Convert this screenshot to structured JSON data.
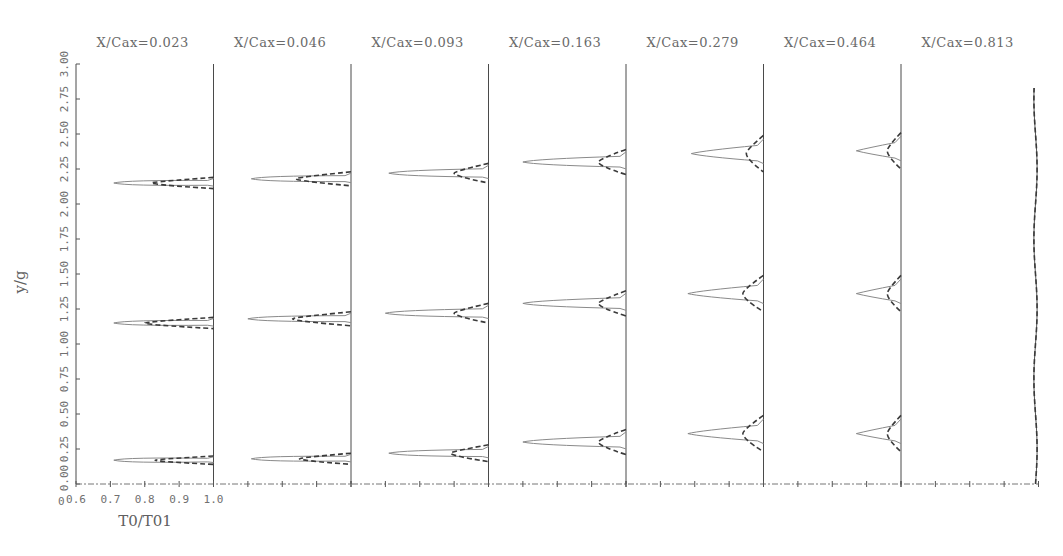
{
  "chart_data": {
    "type": "line",
    "title": "",
    "xlabel": "T0/T01",
    "ylabel": "y/g",
    "ylim": [
      0.0,
      3.0
    ],
    "xlim_per_panel": [
      0.6,
      1.0
    ],
    "y_ticks": [
      "0.00",
      "0.25",
      "0.50",
      "0.75",
      "1.00",
      "1.25",
      "1.50",
      "1.75",
      "2.00",
      "2.25",
      "2.50",
      "2.75",
      "3.00"
    ],
    "x_ticks": [
      "0.6",
      "0.7",
      "0.8",
      "0.9",
      "1.0"
    ],
    "grid": false,
    "legend": null,
    "series_styles": [
      {
        "name": "solid",
        "style": "solid",
        "color": "#8a8a8a"
      },
      {
        "name": "dashed",
        "style": "dashed",
        "color": "#3a3a3a"
      }
    ],
    "panels": [
      {
        "label": "X/Cax=0.023",
        "wakes": [
          {
            "y_center": 0.17,
            "solid_min_x": 0.71,
            "dash_min_x": 0.83,
            "width": 0.06
          },
          {
            "y_center": 1.15,
            "solid_min_x": 0.71,
            "dash_min_x": 0.8,
            "width": 0.08
          },
          {
            "y_center": 2.15,
            "solid_min_x": 0.71,
            "dash_min_x": 0.82,
            "width": 0.08
          }
        ]
      },
      {
        "label": "X/Cax=0.046",
        "wakes": [
          {
            "y_center": 0.18,
            "solid_min_x": 0.71,
            "dash_min_x": 0.85,
            "width": 0.08
          },
          {
            "y_center": 1.18,
            "solid_min_x": 0.7,
            "dash_min_x": 0.83,
            "width": 0.1
          },
          {
            "y_center": 2.18,
            "solid_min_x": 0.71,
            "dash_min_x": 0.84,
            "width": 0.1
          }
        ]
      },
      {
        "label": "X/Cax=0.093",
        "wakes": [
          {
            "y_center": 0.22,
            "solid_min_x": 0.71,
            "dash_min_x": 0.89,
            "width": 0.12
          },
          {
            "y_center": 1.22,
            "solid_min_x": 0.7,
            "dash_min_x": 0.9,
            "width": 0.14
          },
          {
            "y_center": 2.22,
            "solid_min_x": 0.71,
            "dash_min_x": 0.9,
            "width": 0.14
          }
        ]
      },
      {
        "label": "X/Cax=0.163",
        "wakes": [
          {
            "y_center": 0.3,
            "solid_min_x": 0.7,
            "dash_min_x": 0.92,
            "width": 0.18
          },
          {
            "y_center": 1.29,
            "solid_min_x": 0.7,
            "dash_min_x": 0.92,
            "width": 0.18
          },
          {
            "y_center": 2.3,
            "solid_min_x": 0.7,
            "dash_min_x": 0.92,
            "width": 0.18
          }
        ]
      },
      {
        "label": "X/Cax=0.279",
        "wakes": [
          {
            "y_center": 0.36,
            "solid_min_x": 0.78,
            "dash_min_x": 0.94,
            "width": 0.26
          },
          {
            "y_center": 1.36,
            "solid_min_x": 0.78,
            "dash_min_x": 0.94,
            "width": 0.26
          },
          {
            "y_center": 2.36,
            "solid_min_x": 0.79,
            "dash_min_x": 0.95,
            "width": 0.26
          }
        ]
      },
      {
        "label": "X/Cax=0.464",
        "wakes": [
          {
            "y_center": 0.36,
            "solid_min_x": 0.87,
            "dash_min_x": 0.96,
            "width": 0.26
          },
          {
            "y_center": 1.36,
            "solid_min_x": 0.87,
            "dash_min_x": 0.96,
            "width": 0.26
          },
          {
            "y_center": 2.38,
            "solid_min_x": 0.87,
            "dash_min_x": 0.96,
            "width": 0.26
          }
        ]
      },
      {
        "label": "X/Cax=0.813",
        "wakes": [],
        "note": "nearly uniform ~1.0 from y=0.0 to y=2.83"
      }
    ]
  },
  "labels": {
    "panel_0": "X/Cax=0.023",
    "panel_1": "X/Cax=0.046",
    "panel_2": "X/Cax=0.093",
    "panel_3": "X/Cax=0.163",
    "panel_4": "X/Cax=0.279",
    "panel_5": "X/Cax=0.464",
    "panel_6": "X/Cax=0.813",
    "ylabel": "y/g",
    "xlabel": "T0/T01",
    "origin": "0"
  }
}
